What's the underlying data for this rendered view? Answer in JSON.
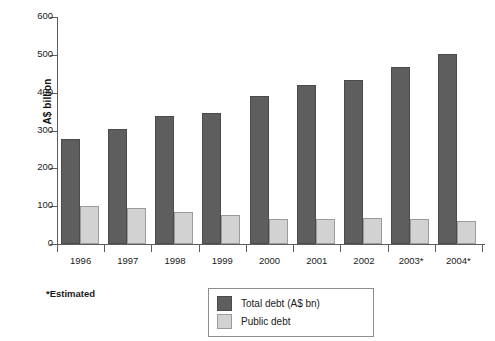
{
  "chart_data": {
    "type": "bar",
    "title": "",
    "xlabel": "",
    "ylabel": "A$ billion",
    "ylim": [
      0,
      600
    ],
    "ytick_step": 100,
    "yticks": [
      600,
      500,
      400,
      300,
      200,
      100,
      0
    ],
    "grid": false,
    "legend_position": "bottom-center",
    "categories": [
      "1996",
      "1997",
      "1998",
      "1999",
      "2000",
      "2001",
      "2002",
      "2003*",
      "2004*"
    ],
    "series": [
      {
        "name": "Total debt (A$ bn)",
        "color": "#5e5e5e",
        "values": [
          277,
          304,
          339,
          345,
          390,
          419,
          433,
          469,
          501
        ]
      },
      {
        "name": "Public debt",
        "color": "#d2d2d2",
        "values": [
          100,
          96,
          85,
          76,
          66,
          66,
          68,
          67,
          62
        ]
      }
    ],
    "footnote": "*Estimated"
  },
  "axis": {
    "y_title": "A$ billion"
  },
  "legend": {
    "items": [
      {
        "label": "Total debt (A$ bn)",
        "swatch": "total"
      },
      {
        "label": "Public debt",
        "swatch": "public"
      }
    ]
  },
  "footnote": {
    "text": "*Estimated"
  }
}
